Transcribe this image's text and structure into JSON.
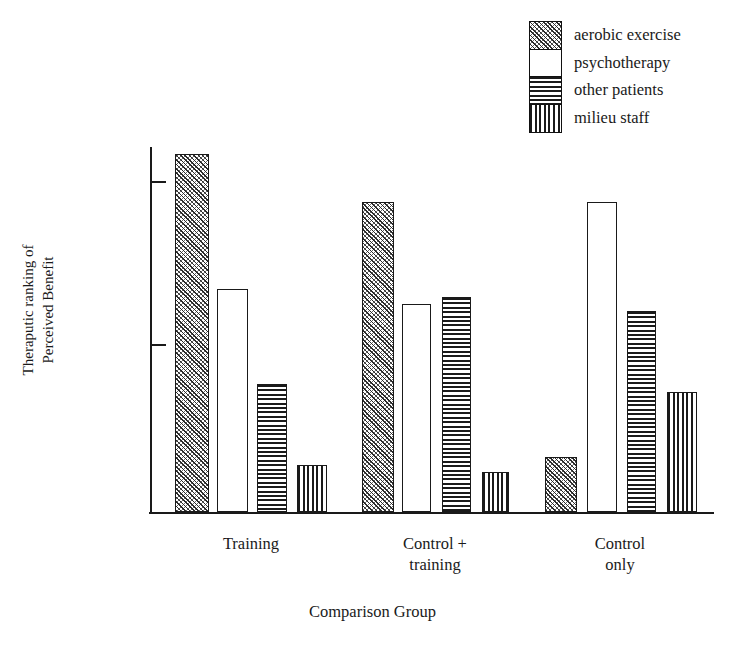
{
  "chart_data": {
    "type": "bar",
    "title": "",
    "xlabel": "Comparison Group",
    "ylabel": "Theraputic ranking of\nPerceived Benefit",
    "categories": [
      "Training",
      "Control +\ntraining",
      "Control\nonly"
    ],
    "series": [
      {
        "name": "aerobic exercise",
        "pattern": "diagonal-hatch",
        "values": [
          98,
          85,
          15
        ]
      },
      {
        "name": "psychotherapy",
        "pattern": "white-empty",
        "values": [
          61,
          57,
          85
        ]
      },
      {
        "name": "other patients",
        "pattern": "horizontal-lines",
        "values": [
          35,
          59,
          55
        ]
      },
      {
        "name": "milieu staff",
        "pattern": "vertical-lines",
        "values": [
          13,
          11,
          33
        ]
      }
    ],
    "ylim": [
      0,
      100
    ],
    "y_tick_values": [
      90,
      45
    ],
    "y_tick_labels": [
      "",
      ""
    ],
    "grid": false,
    "legend_position": "top-right"
  },
  "legend": {
    "items": [
      {
        "label": "aerobic exercise",
        "pattern": "diagonal-hatch"
      },
      {
        "label": "psychotherapy",
        "pattern": "white-empty"
      },
      {
        "label": "other patients",
        "pattern": "horizontal-lines"
      },
      {
        "label": "milieu staff",
        "pattern": "vertical-lines"
      }
    ]
  },
  "axes": {
    "x_title": "Comparison Group",
    "y_title": "Theraputic ranking of\nPerceived Benefit",
    "group_labels": [
      "Training",
      "Control +\ntraining",
      "Control\nonly"
    ]
  },
  "colors": {
    "ink": "#1a1a1a",
    "background": "#ffffff",
    "hatch": "#2a2a2a"
  }
}
